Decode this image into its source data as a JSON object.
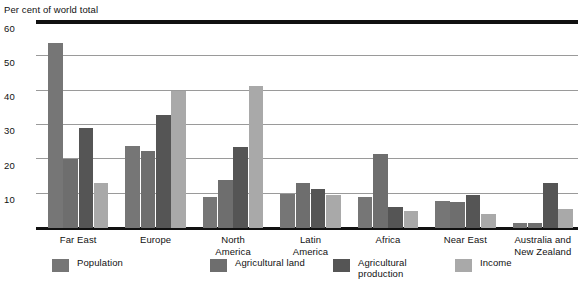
{
  "chart_data": {
    "type": "bar",
    "title": "Per cent of world total",
    "xlabel": "",
    "ylabel": "Per cent of world total",
    "ylim": [
      0,
      60
    ],
    "yticks": [
      10,
      20,
      30,
      40,
      50,
      60
    ],
    "grid": true,
    "legend_position": "bottom",
    "categories": [
      "Far East",
      "Europe",
      "North\nAmerica",
      "Latin\nAmerica",
      "Africa",
      "Near East",
      "Australia and\nNew Zealand"
    ],
    "series": [
      {
        "name": "Population",
        "color": "#767676",
        "values": [
          54,
          24,
          9,
          10,
          9,
          8,
          1.5
        ]
      },
      {
        "name": "Agricultural land",
        "color": "#6e6e6e",
        "values": [
          20,
          22.5,
          14,
          13,
          21.5,
          7.5,
          1.5
        ]
      },
      {
        "name": "Agricultural\nproduction",
        "color": "#555555",
        "values": [
          29,
          33,
          23.5,
          11.5,
          6,
          9.5,
          13
        ]
      },
      {
        "name": "Income",
        "color": "#a9a9a9",
        "values": [
          13,
          40,
          41.5,
          9.5,
          5,
          4,
          5.5
        ]
      }
    ]
  },
  "axis": {
    "title": "Per cent of world total",
    "tick_60": "60",
    "tick_50": "50",
    "tick_40": "40",
    "tick_30": "30",
    "tick_20": "20",
    "tick_10": "10"
  }
}
